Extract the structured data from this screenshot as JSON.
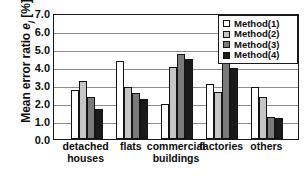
{
  "chart_data": {
    "type": "bar",
    "title": "",
    "xlabel": "",
    "ylabel_prefix": "Mean error ratio ",
    "ylabel_symbol": "e",
    "ylabel_subscript": "j",
    "ylabel_units": " [%]",
    "ylim": [
      0.0,
      7.0
    ],
    "ytick_step": 1.0,
    "yticks": [
      "0.0",
      "1.0",
      "2.0",
      "3.0",
      "4.0",
      "5.0",
      "6.0",
      "7.0"
    ],
    "grid": true,
    "legend_position": "top-right",
    "categories": [
      "detached houses",
      "flats",
      "commercial buildings",
      "factories",
      "others"
    ],
    "category_lines": [
      [
        "detached",
        "houses"
      ],
      [
        "flats"
      ],
      [
        "commercial",
        "buildings"
      ],
      [
        "factories"
      ],
      [
        "others"
      ]
    ],
    "series": [
      {
        "name": "Method(1)",
        "color": "#ffffff",
        "values": [
          2.7,
          4.32,
          1.95,
          3.05,
          2.9
        ]
      },
      {
        "name": "Method(2)",
        "color": "#c6c6c6",
        "values": [
          3.22,
          2.87,
          4.02,
          2.6,
          2.35
        ]
      },
      {
        "name": "Method(3)",
        "color": "#7a7a7a",
        "values": [
          2.32,
          2.56,
          4.75,
          4.26,
          1.25
        ]
      },
      {
        "name": "Method(4)",
        "color": "#1a1a1a",
        "values": [
          1.65,
          2.25,
          4.43,
          3.95,
          1.15
        ]
      }
    ]
  }
}
